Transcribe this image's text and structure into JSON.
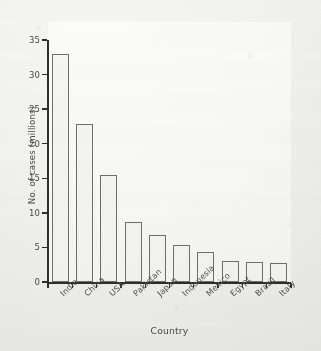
{
  "chart_data": {
    "type": "bar",
    "title": "",
    "xlabel": "Country",
    "ylabel": "No. of cases (millions)",
    "categories": [
      "India",
      "China",
      "USA",
      "Pakistan",
      "Japan",
      "Indonesia",
      "Mexico",
      "Egypt",
      "Brazil",
      "Italy"
    ],
    "values": [
      33.0,
      22.8,
      15.5,
      8.7,
      6.8,
      5.4,
      4.3,
      3.0,
      2.9,
      2.7
    ],
    "ylim": [
      0,
      35
    ],
    "yticks": [
      0,
      5,
      10,
      15,
      20,
      25,
      30,
      35
    ],
    "ytick_labels": [
      "0",
      "5",
      "10",
      "15",
      "20",
      "25",
      "30",
      "35"
    ],
    "grid": false,
    "legend": false,
    "legend_position": "none",
    "bar_fill": "#f6f6f4",
    "bar_border": "#6f6f6f",
    "axis_color": "#2e2e2e",
    "background": "#f2f2f0"
  }
}
